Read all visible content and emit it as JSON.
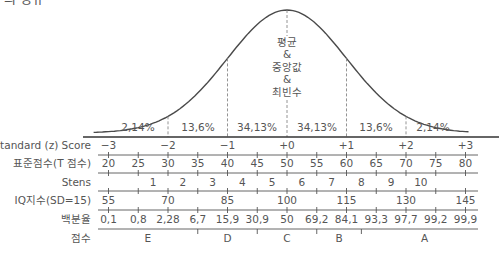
{
  "title": "의 정규",
  "colors": {
    "curve": "#4a4a4a",
    "text": "#555555",
    "axis": "#444444",
    "dashed": "#888888",
    "background": "#ffffff"
  },
  "center_label": [
    "평균",
    "&",
    "중앙값",
    "&",
    "최빈수"
  ],
  "rows": [
    {
      "label": "Standard (z) Score",
      "values": [
        "−3",
        "−2",
        "−1",
        "+0",
        "+1",
        "+2",
        "+3"
      ]
    },
    {
      "label": "표준점수(T 점수)",
      "values": [
        "20",
        "25",
        "30",
        "35",
        "40",
        "45",
        "50",
        "55",
        "60",
        "65",
        "70",
        "75",
        "80"
      ]
    },
    {
      "label": "Stens",
      "values": [
        "1",
        "2",
        "3",
        "4",
        "5",
        "6",
        "7",
        "8",
        "9",
        "10"
      ]
    },
    {
      "label": "IQ지수(SD=15)",
      "values": [
        "55",
        "70",
        "85",
        "100",
        "115",
        "130",
        "145"
      ]
    },
    {
      "label": "백분율",
      "values": [
        "0.1",
        "0.8",
        "2.28",
        "6.7",
        "15.9",
        "30.9",
        "50",
        "69.2",
        "84.1",
        "93.3",
        "97.7",
        "99.2",
        "99.9"
      ]
    },
    {
      "label": "점수",
      "values": [
        "E",
        "D",
        "C",
        "B",
        "A"
      ]
    }
  ],
  "percentile_display": [
    "0,1",
    "0,8",
    "2,28",
    "6,7",
    "15,9",
    "30,9",
    "50",
    "69,2",
    "84,1",
    "93,3",
    "97,7",
    "99,2",
    "99,9"
  ],
  "chart_data": {
    "type": "area",
    "x": [
      -3,
      -2,
      -1,
      0,
      1,
      2,
      3
    ],
    "area_percentages": [
      {
        "range": [
          -3,
          -2
        ],
        "label": "2,14%",
        "value": 2.14
      },
      {
        "range": [
          -2,
          -1
        ],
        "label": "13,6%",
        "value": 13.6
      },
      {
        "range": [
          -1,
          0
        ],
        "label": "34,13%",
        "value": 34.13
      },
      {
        "range": [
          0,
          1
        ],
        "label": "34,13%",
        "value": 34.13
      },
      {
        "range": [
          1,
          2
        ],
        "label": "13,6%",
        "value": 13.6
      },
      {
        "range": [
          2,
          3
        ],
        "label": "2,14%",
        "value": 2.14
      }
    ],
    "center_annotation": "평균 & 중앙값 & 최빈수",
    "scales": {
      "z_score": [
        -3,
        -2,
        -1,
        0,
        1,
        2,
        3
      ],
      "t_score": [
        20,
        25,
        30,
        35,
        40,
        45,
        50,
        55,
        60,
        65,
        70,
        75,
        80
      ],
      "stens": [
        1,
        2,
        3,
        4,
        5,
        6,
        7,
        8,
        9,
        10
      ],
      "iq_sd15": [
        55,
        70,
        85,
        100,
        115,
        130,
        145
      ],
      "percentile": [
        0.1,
        0.8,
        2.28,
        6.7,
        15.9,
        30.9,
        50,
        69.2,
        84.1,
        93.3,
        97.7,
        99.2,
        99.9
      ],
      "grade": [
        "E",
        "D",
        "C",
        "B",
        "A"
      ]
    },
    "grade_boundaries_z": [
      -1.5,
      -0.5,
      0.5,
      1.25
    ],
    "xlim": [
      -3.4,
      3.5
    ],
    "grid": false,
    "legend": "none"
  }
}
